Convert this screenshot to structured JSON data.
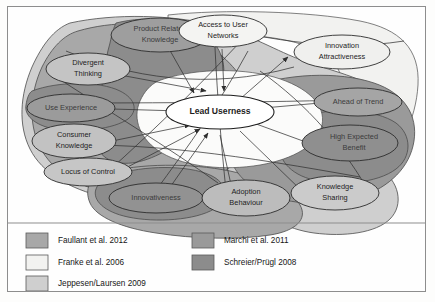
{
  "figure": {
    "center_node": {
      "label": "Lead Userness"
    },
    "nodes": [
      {
        "id": "product-related-knowledge",
        "label_line1": "Product Related",
        "label_line2": "Knowledge"
      },
      {
        "id": "access-to-user-networks",
        "label_line1": "Access to User",
        "label_line2": "Networks"
      },
      {
        "id": "divergent-thinking",
        "label_line1": "Divergent",
        "label_line2": "Thinking"
      },
      {
        "id": "innovation-attractiveness",
        "label_line1": "Innovation",
        "label_line2": "Attractiveness"
      },
      {
        "id": "use-experience",
        "label_line1": "Use Experience",
        "label_line2": ""
      },
      {
        "id": "ahead-of-trend",
        "label_line1": "Ahead of Trend",
        "label_line2": ""
      },
      {
        "id": "consumer-knowledge",
        "label_line1": "Consumer",
        "label_line2": "Knowledge"
      },
      {
        "id": "high-expected-benefit",
        "label_line1": "High Expected",
        "label_line2": "Benefit"
      },
      {
        "id": "locus-of-control",
        "label_line1": "Locus of Control",
        "label_line2": ""
      },
      {
        "id": "innovativeness",
        "label_line1": "Innovativeness",
        "label_line2": ""
      },
      {
        "id": "adoption-behaviour",
        "label_line1": "Adoption",
        "label_line2": "Behaviour"
      },
      {
        "id": "knowledge-sharing",
        "label_line1": "Knowledge",
        "label_line2": "Sharing"
      }
    ]
  },
  "legend": {
    "entries": [
      {
        "id": "faullant",
        "label": "Faullant et al. 2012",
        "color": "#a8a8a8",
        "column": 1,
        "row": 1
      },
      {
        "id": "franke",
        "label": "Franke et al. 2006",
        "color": "#f2f2f0",
        "column": 1,
        "row": 2
      },
      {
        "id": "jeppesen",
        "label": "Jeppesen/Laursen 2009",
        "color": "#cfcfcf",
        "column": 1,
        "row": 3
      },
      {
        "id": "marchi",
        "label": "Marchi et al. 2011",
        "color": "#9a9a9a",
        "column": 2,
        "row": 1
      },
      {
        "id": "schreier",
        "label": "Schreier/Prügl 2008",
        "color": "#8c8c8c",
        "column": 2,
        "row": 2
      }
    ]
  },
  "colors": {
    "stroke": "#4b4b4b",
    "arrow": "#333333",
    "node_fill": "#fbfbfa",
    "band_jeppesen": "#cfcfcf",
    "band_faullant": "#a8a8a8",
    "band_marchi": "#9a9a9a",
    "band_schreier": "#8c8c8c",
    "band_franke": "#f2f2f0",
    "frame": "#8d8d8d",
    "background": "#fefefe"
  }
}
